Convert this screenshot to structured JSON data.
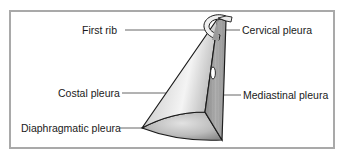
{
  "figure": {
    "labels": {
      "first_rib": "First rib",
      "cervical_pleura": "Cervical pleura",
      "costal_pleura": "Costal pleura",
      "mediastinal_pleura": "Mediastinal pleura",
      "diaphragmatic_pleura": "Diaphragmatic pleura"
    },
    "colors": {
      "border": "#a9a9a9",
      "outline": "#1a1a1a",
      "leader_line": "#555555",
      "text": "#1a1a1a"
    }
  }
}
